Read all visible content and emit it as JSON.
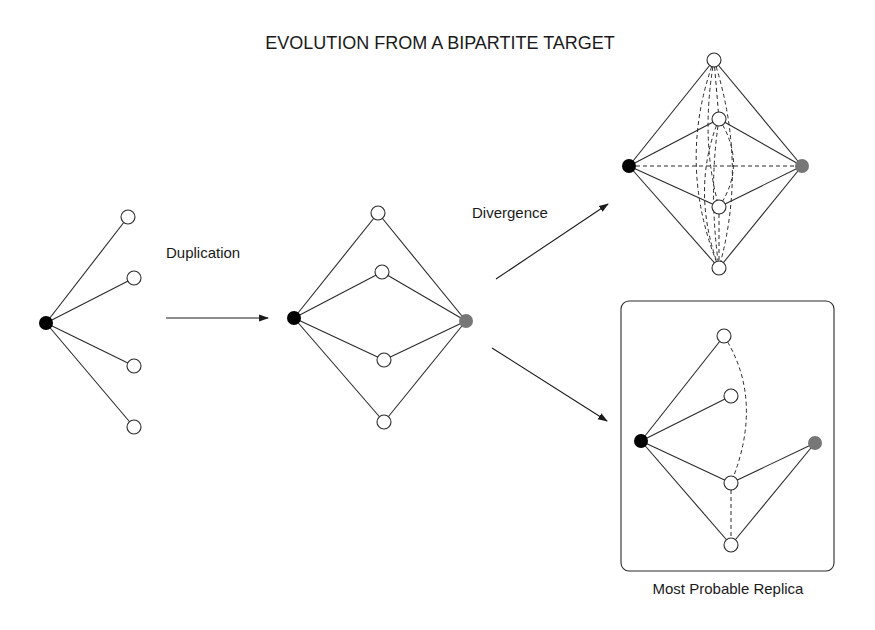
{
  "title": "EVOLUTION FROM A BIPARTITE TARGET",
  "steps": {
    "duplication_label": "Duplication",
    "divergence_label": "Divergence",
    "replica_label": "Most Probable Replica"
  },
  "colors": {
    "hub_node": "#000000",
    "duplicate_hub_node": "#777777",
    "target_node": "#ffffff",
    "edge": "#2a2a2a"
  },
  "graphs": [
    {
      "name": "original-star",
      "hubs": 1,
      "targets": 4,
      "dashed_edges": 0
    },
    {
      "name": "duplicated-bipartite",
      "hubs": 2,
      "targets": 4,
      "dashed_edges": 0
    },
    {
      "name": "divergence-possibilities",
      "hubs": 2,
      "targets": 4,
      "dashed_edges": "many"
    },
    {
      "name": "most-probable-replica",
      "hubs": 2,
      "targets": 4,
      "dashed_edges": 2
    }
  ]
}
